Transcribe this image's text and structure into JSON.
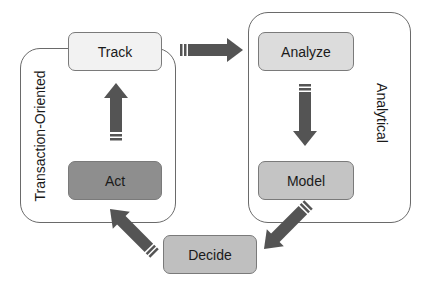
{
  "diagram": {
    "groups": [
      {
        "id": "transaction",
        "label": "Transaction-Oriented"
      },
      {
        "id": "analytical",
        "label": "Analytical"
      }
    ],
    "nodes": [
      {
        "id": "track",
        "label": "Track",
        "group": "transaction",
        "fill": "#f2f2f2"
      },
      {
        "id": "act",
        "label": "Act",
        "group": "transaction",
        "fill": "#8e8e8e"
      },
      {
        "id": "analyze",
        "label": "Analyze",
        "group": "analytical",
        "fill": "#dcdcdc"
      },
      {
        "id": "model",
        "label": "Model",
        "group": "analytical",
        "fill": "#c4c4c4"
      },
      {
        "id": "decide",
        "label": "Decide",
        "group": null,
        "fill": "#bfbfbf"
      }
    ],
    "edges": [
      {
        "from": "track",
        "to": "analyze"
      },
      {
        "from": "analyze",
        "to": "model"
      },
      {
        "from": "model",
        "to": "decide"
      },
      {
        "from": "decide",
        "to": "act"
      },
      {
        "from": "act",
        "to": "track"
      }
    ],
    "arrow_color": "#545454"
  }
}
